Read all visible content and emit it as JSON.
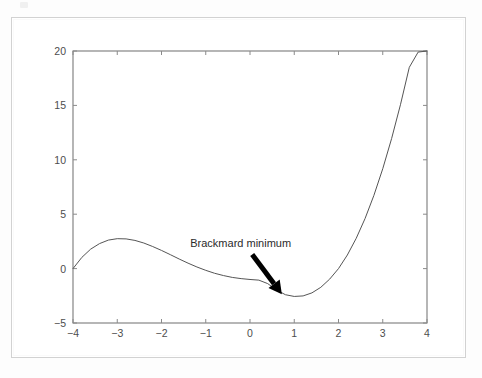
{
  "figure": {
    "background_color": "#ffffff",
    "frame_color": "#d2d2d2"
  },
  "chart_data": {
    "type": "line",
    "title": "",
    "xlabel": "",
    "ylabel": "",
    "xlim": [
      -4,
      4
    ],
    "ylim": [
      -5,
      20
    ],
    "grid": false,
    "legend_position": "none",
    "line_color": "#555555",
    "line_width": 1,
    "xticks": [
      -4,
      -3,
      -2,
      -1,
      0,
      1,
      2,
      3,
      4
    ],
    "xtick_labels": [
      "−4",
      "−3",
      "−2",
      "−1",
      "0",
      "1",
      "2",
      "3",
      "4"
    ],
    "yticks": [
      -5,
      0,
      5,
      10,
      15,
      20
    ],
    "ytick_labels": [
      "−5",
      "0",
      "5",
      "10",
      "15",
      "20"
    ],
    "series": [
      {
        "name": "f(x)",
        "x": [
          -4.0,
          -3.8,
          -3.6,
          -3.4,
          -3.2,
          -3.0,
          -2.8,
          -2.6,
          -2.4,
          -2.2,
          -2.0,
          -1.8,
          -1.6,
          -1.4,
          -1.2,
          -1.0,
          -0.8,
          -0.6,
          -0.4,
          -0.2,
          0.0,
          0.2,
          0.4,
          0.6,
          0.8,
          1.0,
          1.2,
          1.4,
          1.6,
          1.8,
          2.0,
          2.2,
          2.4,
          2.6,
          2.8,
          3.0,
          3.2,
          3.4,
          3.6,
          3.8,
          4.0
        ],
        "y": [
          0.0,
          1.03,
          1.79,
          2.3,
          2.62,
          2.75,
          2.73,
          2.59,
          2.35,
          2.03,
          1.67,
          1.28,
          0.88,
          0.5,
          0.15,
          -0.16,
          -0.43,
          -0.64,
          -0.81,
          -0.92,
          -1.0,
          -1.06,
          -1.38,
          -1.96,
          -2.4,
          -2.56,
          -2.51,
          -2.23,
          -1.72,
          -0.97,
          0.0,
          1.25,
          2.78,
          4.6,
          6.73,
          9.18,
          11.95,
          15.06,
          18.5,
          19.9,
          20.0
        ]
      }
    ],
    "annotations": [
      {
        "text": "Brackmard minimum",
        "text_x": -1.35,
        "text_y": 2.0,
        "arrow_tail_x": 0.05,
        "arrow_tail_y": 1.3,
        "arrow_tip_x": 0.72,
        "arrow_tip_y": -2.35,
        "arrow_color": "#000000",
        "arrow_width": 5
      }
    ]
  },
  "annotation_label": "Brackmard minimum"
}
